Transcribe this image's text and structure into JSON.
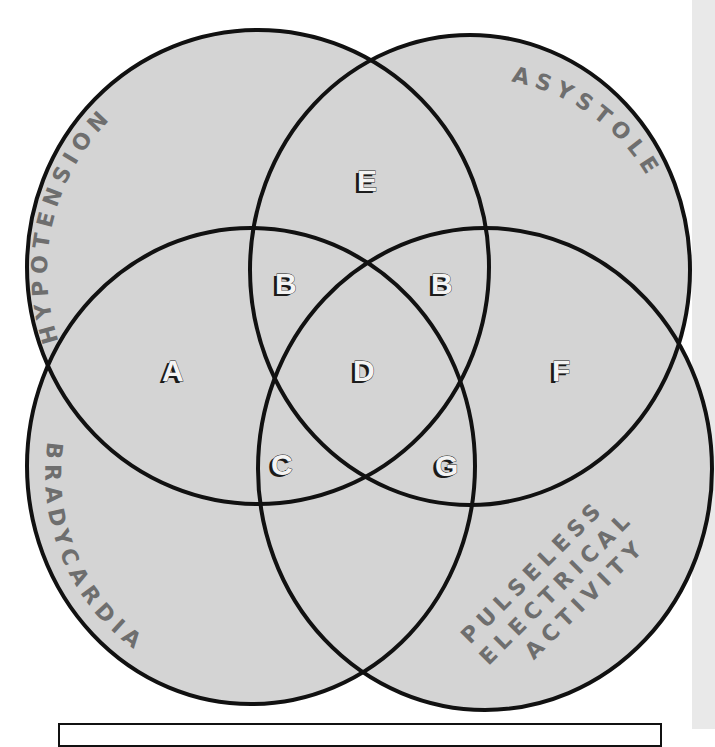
{
  "diagram": {
    "type": "venn",
    "sets": [
      {
        "id": "hypotension",
        "label": "HYPOTENSION"
      },
      {
        "id": "asystole",
        "label": "ASYSTOLE"
      },
      {
        "id": "bradycardia",
        "label": "BRADYCARDIA"
      },
      {
        "id": "pea",
        "label_lines": [
          "PULSELESS",
          "ELECTRICAL",
          "ACTIVITY"
        ]
      }
    ],
    "regions": {
      "A": "A",
      "B_left": "B",
      "B_right": "B",
      "C": "C",
      "D": "D",
      "E": "E",
      "F": "F",
      "G": "G"
    },
    "colors": {
      "fill": "#d4d4d4",
      "outline": "#111111",
      "set_label": "#6e6e6e",
      "region_letter": "#f4f4f4"
    }
  }
}
